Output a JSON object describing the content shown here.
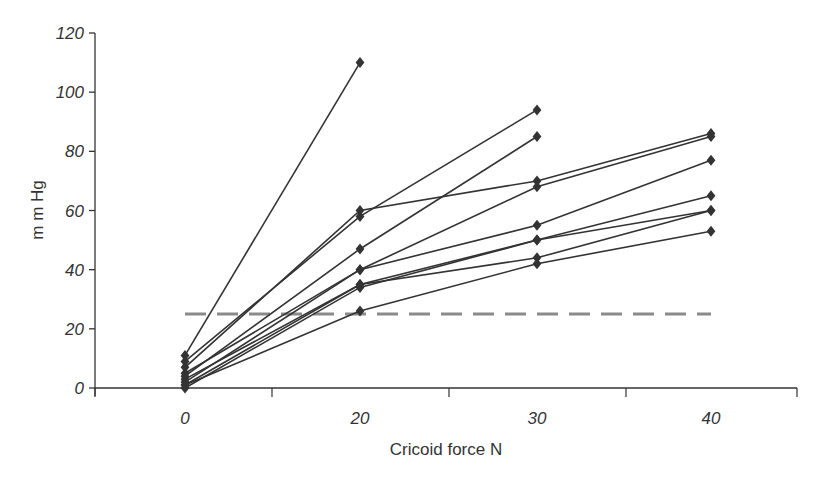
{
  "chart_data": {
    "type": "line",
    "title": "",
    "xlabel": "Cricoid force N",
    "ylabel": "m m Hg",
    "categories": [
      "0",
      "20",
      "30",
      "40"
    ],
    "ylim": [
      0,
      120
    ],
    "yticks": [
      0,
      20,
      40,
      60,
      80,
      100,
      120
    ],
    "grid": false,
    "legend": null,
    "series": [
      {
        "name": "Subject 1",
        "values": [
          11,
          110,
          null,
          null
        ]
      },
      {
        "name": "Subject 2",
        "values": [
          9,
          58,
          94,
          null
        ]
      },
      {
        "name": "Subject 3",
        "values": [
          7,
          60,
          70,
          86
        ]
      },
      {
        "name": "Subject 4",
        "values": [
          4,
          47,
          85,
          null
        ]
      },
      {
        "name": "Subject 5",
        "values": [
          2,
          40,
          68,
          85
        ]
      },
      {
        "name": "Subject 6",
        "values": [
          5,
          40,
          55,
          77
        ]
      },
      {
        "name": "Subject 7",
        "values": [
          1,
          35,
          50,
          65
        ]
      },
      {
        "name": "Subject 8",
        "values": [
          0,
          34,
          50,
          60
        ]
      },
      {
        "name": "Subject 9",
        "values": [
          3,
          35,
          44,
          60
        ]
      },
      {
        "name": "Subject 10",
        "values": [
          1,
          26,
          42,
          53
        ]
      }
    ],
    "annotations": [
      {
        "type": "horizontal-dashed-line",
        "y": 25,
        "x_range": [
          "0",
          "40"
        ],
        "color": "#8a8a8a"
      }
    ],
    "colors": {
      "line": "#333333",
      "marker": "#333333",
      "threshold": "#8a8a8a",
      "axis": "#333333"
    }
  }
}
